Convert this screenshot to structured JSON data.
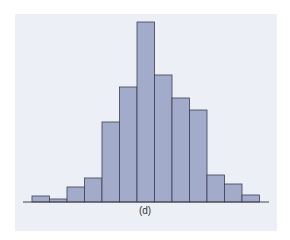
{
  "chart_data": {
    "type": "bar",
    "title": "",
    "caption": "(d)",
    "xlabel": "",
    "ylabel": "",
    "grid": false,
    "legend": null,
    "categories": [
      "1",
      "2",
      "3",
      "4",
      "5",
      "6",
      "7",
      "8",
      "9",
      "10",
      "11",
      "12",
      "13"
    ],
    "values": [
      6,
      3,
      15,
      24,
      80,
      115,
      180,
      127,
      104,
      92,
      27,
      18,
      7
    ],
    "ylim": [
      0,
      190
    ],
    "colors": {
      "bar_fill": "#a3abcb",
      "bar_edge": "#3c3f55",
      "axis": "#444444",
      "panel": "#eceff6"
    }
  }
}
